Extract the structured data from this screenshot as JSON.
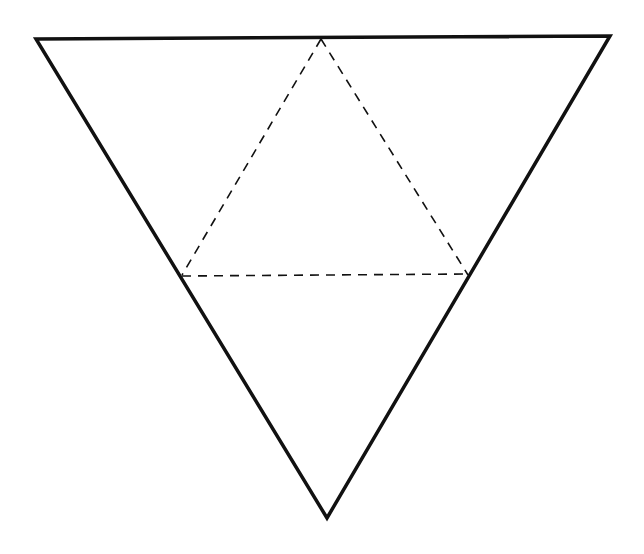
{
  "diagram": {
    "type": "triangle-net",
    "background": "#ffffff",
    "stroke_color": "#111111",
    "outer_triangle": {
      "style": "solid",
      "stroke_width": 3.5,
      "points": [
        [
          36,
          39
        ],
        [
          610,
          36
        ],
        [
          327,
          518
        ]
      ]
    },
    "fold_lines": {
      "style": "dashed",
      "stroke_width": 1.6,
      "dash": "9 7",
      "segments": [
        {
          "name": "left-fold",
          "from": [
            321,
            39
          ],
          "to": [
            182,
            275
          ]
        },
        {
          "name": "right-fold",
          "from": [
            321,
            39
          ],
          "to": [
            468,
            275
          ]
        },
        {
          "name": "bottom-fold",
          "from": [
            182,
            276
          ],
          "to": [
            468,
            274
          ]
        }
      ]
    }
  }
}
